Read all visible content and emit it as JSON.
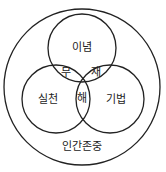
{
  "diagram": {
    "outer_label": "인간존중",
    "circles": [
      {
        "id": "top",
        "label": "이념"
      },
      {
        "id": "left",
        "label": "실천"
      },
      {
        "id": "right",
        "label": "기법"
      }
    ],
    "intersections": {
      "top_left": "무",
      "top_right": "재",
      "left_right": "해"
    },
    "stroke_color": "#222222"
  }
}
